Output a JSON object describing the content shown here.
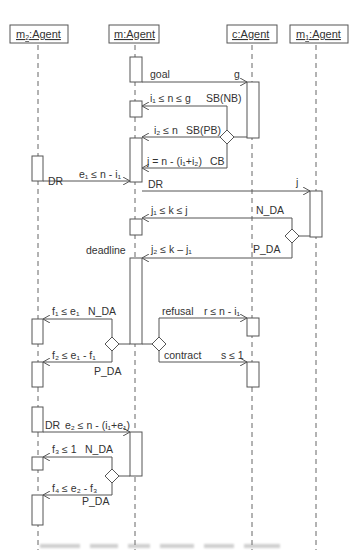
{
  "diagram": {
    "type": "UML sequence diagram",
    "lifelines": [
      {
        "id": "m2",
        "label": "m",
        "sub": "2",
        "suffix": ":Agent"
      },
      {
        "id": "m",
        "label": "m:Agent"
      },
      {
        "id": "c",
        "label": "c:Agent"
      },
      {
        "id": "m1",
        "label": "m",
        "sub": "1",
        "suffix": ":Agent"
      }
    ],
    "messages": {
      "goal": "goal",
      "g": "g",
      "i1_cond": "i₁ ≤ n ≤ g",
      "sb_nb": "SB(NB)",
      "i2_cond": "i₂ ≤ n",
      "sb_pb": "SB(PB)",
      "j_cond": "j = n - (i₁+i₂)",
      "cb": "CB",
      "dr1": "DR",
      "e1_cond": "e₁ ≤ n - i₁",
      "dr2": "DR",
      "j": "j",
      "j1_cond": "j₁ ≤ k ≤ j",
      "n_da1": "N_DA",
      "deadline": "deadline",
      "j2_cond": "j₂ ≤ k – j₁",
      "p_da1": "P_DA",
      "f1_cond": "f₁ ≤ e₁",
      "n_da2": "N_DA",
      "refusal": "refusal",
      "r_cond": "r ≤ n - i₁",
      "f2_cond": "f₂ ≤ e₁ - f₁",
      "p_da2": "P_DA",
      "contract": "contract",
      "s_cond": "s ≤ 1",
      "dr3": "DR",
      "e2_cond": "e₂ ≤ n - (i₁+e₁)",
      "f3_cond": "f₃ ≤ 1",
      "n_da3": "N_DA",
      "f4_cond": "f₄ ≤ e₂ - f₃",
      "p_da3": "P_DA"
    },
    "colors": {
      "line": "#555555",
      "text": "#333333",
      "background": "#ffffff"
    }
  }
}
